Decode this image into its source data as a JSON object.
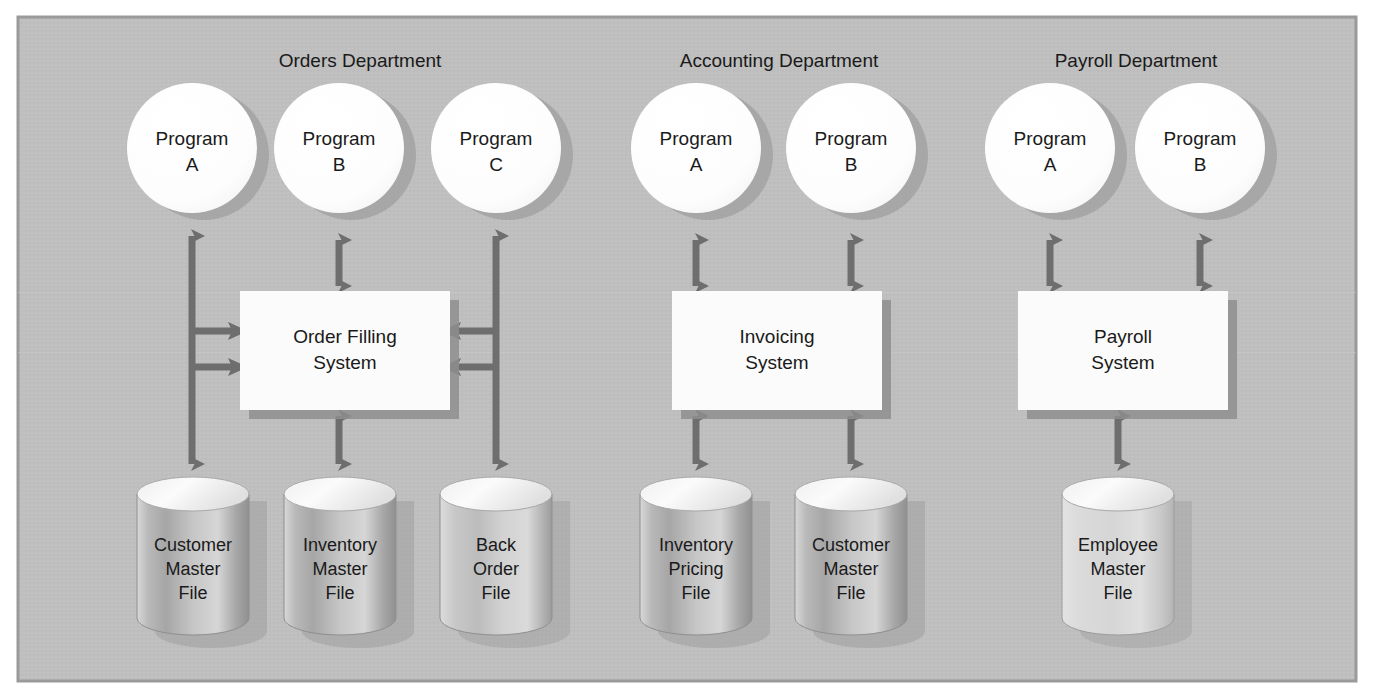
{
  "figure": {
    "panel_color": "#bfbfbf",
    "panel_border_color": "#9a9a9a",
    "page_background": "#ffffff",
    "arrow_color": "#6e6e6e",
    "box_fill": "#fbfbfb",
    "box_shadow_color": "#8e8e8e",
    "circle_fill": "#fcfcfc",
    "circle_shadow_color": "#8e8e8e",
    "text_color": "#1a1a1a"
  },
  "departments": [
    {
      "id": "orders",
      "label": "Orders Department",
      "programs": [
        {
          "line1": "Program",
          "line2": "A"
        },
        {
          "line1": "Program",
          "line2": "B"
        },
        {
          "line1": "Program",
          "line2": "C"
        }
      ],
      "system": {
        "line1": "Order Filling",
        "line2": "System"
      },
      "files": [
        {
          "line1": "Customer",
          "line2": "Master",
          "line3": "File",
          "shade": "dark"
        },
        {
          "line1": "Inventory",
          "line2": "Master",
          "line3": "File",
          "shade": "dark"
        },
        {
          "line1": "Back",
          "line2": "Order",
          "line3": "File",
          "shade": "medium"
        }
      ]
    },
    {
      "id": "accounting",
      "label": "Accounting Department",
      "programs": [
        {
          "line1": "Program",
          "line2": "A"
        },
        {
          "line1": "Program",
          "line2": "B"
        }
      ],
      "system": {
        "line1": "Invoicing",
        "line2": "System"
      },
      "files": [
        {
          "line1": "Inventory",
          "line2": "Pricing",
          "line3": "File",
          "shade": "dark"
        },
        {
          "line1": "Customer",
          "line2": "Master",
          "line3": "File",
          "shade": "dark"
        }
      ]
    },
    {
      "id": "payroll",
      "label": "Payroll Department",
      "programs": [
        {
          "line1": "Program",
          "line2": "A"
        },
        {
          "line1": "Program",
          "line2": "B"
        }
      ],
      "system": {
        "line1": "Payroll",
        "line2": "System"
      },
      "files": [
        {
          "line1": "Employee",
          "line2": "Master",
          "line3": "File",
          "shade": "light"
        }
      ]
    }
  ]
}
